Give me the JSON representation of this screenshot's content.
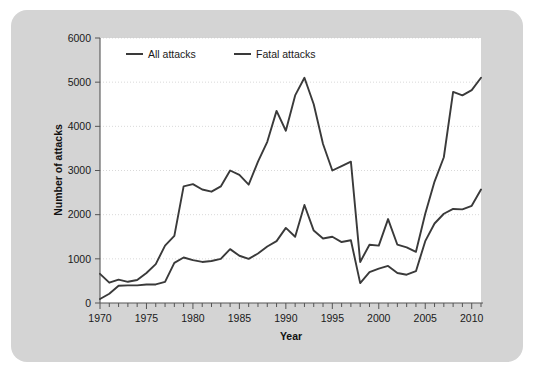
{
  "chart_data": {
    "type": "line",
    "title": "",
    "xlabel": "Year",
    "ylabel": "Number of attacks",
    "xlim": [
      1970,
      2011
    ],
    "ylim": [
      0,
      6000
    ],
    "xticks": [
      1970,
      1975,
      1980,
      1985,
      1990,
      1995,
      2000,
      2005,
      2010
    ],
    "xtick_labels": [
      "1970",
      "1975",
      "1980",
      "1985",
      "1990",
      "1995",
      "2000",
      "2005",
      "2010"
    ],
    "yticks": [
      0,
      1000,
      2000,
      3000,
      4000,
      5000,
      6000
    ],
    "ytick_labels": [
      "0",
      "1000",
      "2000",
      "3000",
      "4000",
      "5000",
      "6000"
    ],
    "grid": true,
    "legend_position": "top-left-inside",
    "x": [
      1970,
      1971,
      1972,
      1973,
      1974,
      1975,
      1976,
      1977,
      1978,
      1979,
      1980,
      1981,
      1982,
      1983,
      1984,
      1985,
      1986,
      1987,
      1988,
      1989,
      1990,
      1991,
      1992,
      1993,
      1994,
      1995,
      1996,
      1997,
      1998,
      1999,
      2000,
      2001,
      2002,
      2003,
      2004,
      2005,
      2006,
      2007,
      2008,
      2009,
      2010,
      2011
    ],
    "series": [
      {
        "name": "All attacks",
        "color": "#3a3a3a",
        "values": [
          660,
          460,
          530,
          480,
          520,
          680,
          880,
          1300,
          1520,
          2640,
          2690,
          2570,
          2520,
          2640,
          3000,
          2900,
          2680,
          3200,
          3650,
          4350,
          3900,
          4700,
          5100,
          4500,
          3600,
          3000,
          3100,
          3200,
          930,
          1320,
          1300,
          1900,
          1320,
          1260,
          1160,
          2020,
          2750,
          3300,
          4780,
          4700,
          4820,
          5100
        ]
      },
      {
        "name": "Fatal attacks",
        "color": "#3a3a3a",
        "values": [
          90,
          210,
          390,
          400,
          400,
          420,
          420,
          480,
          910,
          1030,
          970,
          930,
          950,
          1000,
          1220,
          1070,
          1000,
          1120,
          1280,
          1400,
          1700,
          1500,
          2220,
          1640,
          1460,
          1500,
          1380,
          1420,
          450,
          700,
          780,
          840,
          680,
          640,
          720,
          1400,
          1800,
          2020,
          2130,
          2120,
          2200,
          2570
        ]
      }
    ]
  },
  "axes": {
    "ylabel": "Number of attacks",
    "xlabel": "Year"
  },
  "legend": {
    "items": [
      {
        "label": "All attacks"
      },
      {
        "label": "Fatal attacks"
      }
    ]
  }
}
